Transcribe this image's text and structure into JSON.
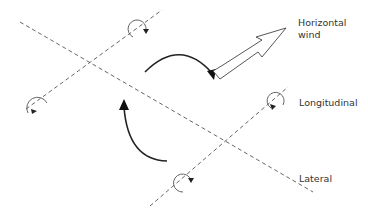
{
  "diagram": {
    "labels": {
      "wind_line1": "Horizontal",
      "wind_line2": "wind",
      "longitudinal": "Longitudinal",
      "lateral": "Lateral"
    },
    "axes": [
      {
        "name": "lateral",
        "style": "dashed"
      },
      {
        "name": "longitudinal-upper",
        "style": "dashed"
      },
      {
        "name": "longitudinal-lower",
        "style": "dashed"
      }
    ],
    "rotation_markers": 4,
    "turn_arrows": 2,
    "colors": {
      "line": "#555555",
      "arrow": "#222222",
      "text": "#333333",
      "background": "#ffffff"
    }
  }
}
